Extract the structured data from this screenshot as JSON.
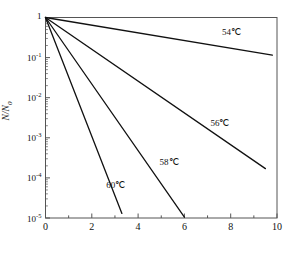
{
  "chart_data": {
    "type": "line",
    "title": "",
    "xlabel": "",
    "ylabel": "N/N0",
    "ylabel_display": "N/N",
    "ylabel_sub": "0",
    "xlim": [
      0,
      10
    ],
    "ylim": [
      1e-05,
      1
    ],
    "yscale": "log",
    "grid": false,
    "legend_position": "inline-annotations",
    "xticks": [
      0,
      2,
      4,
      6,
      8,
      10
    ],
    "xtick_labels": [
      "0",
      "2",
      "4",
      "6",
      "8",
      "10"
    ],
    "x_minor_ticks": [
      1,
      3,
      5,
      7,
      9
    ],
    "yticks": [
      1,
      0.1,
      0.01,
      0.001,
      0.0001,
      1e-05
    ],
    "ytick_labels": [
      "1",
      "10-1",
      "10-2",
      "10-3",
      "10-4",
      "10-5"
    ],
    "ytick_mantissa": [
      "1",
      "10",
      "10",
      "10",
      "10",
      "10"
    ],
    "ytick_exponent": [
      "",
      "-1",
      "-2",
      "-3",
      "-4",
      "-5"
    ],
    "series": [
      {
        "name": "54C",
        "label": "54℃",
        "color": "#111111",
        "x": [
          0,
          9.8
        ],
        "y": [
          1.0,
          0.115
        ],
        "label_x": 8.1,
        "label_y": 0.42
      },
      {
        "name": "56C",
        "label": "56℃",
        "color": "#111111",
        "x": [
          0,
          9.5
        ],
        "y": [
          1.0,
          0.00017
        ],
        "label_x": 7.6,
        "label_y": 0.0022
      },
      {
        "name": "58C",
        "label": "58℃",
        "color": "#111111",
        "x": [
          0,
          6.0
        ],
        "y": [
          1.0,
          1.05e-05
        ],
        "label_x": 5.4,
        "label_y": 0.00023
      },
      {
        "name": "60C",
        "label": "60℃",
        "color": "#111111",
        "x": [
          0,
          3.3
        ],
        "y": [
          1.0,
          1.3e-05
        ],
        "label_x": 3.1,
        "label_y": 6.2e-05
      }
    ]
  },
  "axes": {
    "frame_color": "#555555",
    "frame_width": 1,
    "line_color": "#111111",
    "line_width": 1.3
  }
}
